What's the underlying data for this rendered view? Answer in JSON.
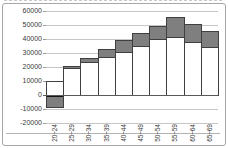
{
  "chart_data": {
    "type": "bar",
    "stacked": true,
    "title": "",
    "xlabel": "",
    "ylabel": "",
    "categories": [
      "20~24",
      "25~29",
      "30~34",
      "35~39",
      "40~44",
      "45~49",
      "50~54",
      "55~59",
      "60~64",
      "65~69"
    ],
    "series": [
      {
        "name": "white-segment",
        "color": "#ffffff",
        "values": [
          9800,
          19500,
          23500,
          27500,
          31000,
          35000,
          40000,
          41500,
          38000,
          34000
        ]
      },
      {
        "name": "gray-segment",
        "color": "#7f7f7f",
        "values": [
          -9500,
          1500,
          3000,
          5500,
          8000,
          9000,
          9500,
          14500,
          13000,
          11500
        ]
      }
    ],
    "ylim": [
      -20000,
      60000
    ],
    "ytick_step": 10000,
    "yticks": [
      "60000",
      "50000",
      "40000",
      "30000",
      "20000",
      "10000",
      "0",
      "-10000",
      "-20000"
    ],
    "grid": true,
    "legend": false,
    "x_label_rotation_deg": 90
  },
  "colors": {
    "background": "#ffffff",
    "frame_border": "#a6a6a6",
    "gridline": "#c6c6c6",
    "axis_line": "#5a5a5a",
    "bar_border": "#404040",
    "bar_white_fill": "#ffffff",
    "bar_gray_fill": "#7f7f7f",
    "negative_cap": "#161616",
    "text": "#3a3a3a"
  }
}
